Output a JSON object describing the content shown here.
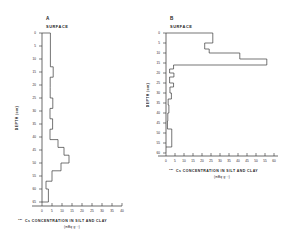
{
  "figure": {
    "background": "#ffffff",
    "line_color": "#3a3a3a",
    "axis_color": "#2b2b2b"
  },
  "chart_data": [
    {
      "type": "area",
      "panel_label": "A",
      "surface_label": "SURFACE",
      "title": "",
      "xlabel": "137Cs CONCENTRATION IN SILT AND CLAY",
      "xlabel_isotope_sup": "137",
      "xlabel_main": "Cs CONCENTRATION IN SILT AND CLAY",
      "xunits": "(mBq·g⁻¹)",
      "ylabel": "DEPTH (cm)",
      "xlim": [
        0,
        40
      ],
      "ylim": [
        0,
        65
      ],
      "grid": false,
      "legend": "none",
      "orientation": "vertical-depth-profile",
      "xticks": [
        0,
        5,
        10,
        15,
        20,
        25,
        30,
        35,
        40
      ],
      "xticklabels": [
        "0",
        "5",
        "10",
        "15",
        "20",
        "25",
        "30",
        "35",
        "40"
      ],
      "yticks": [
        0,
        5,
        10,
        15,
        20,
        25,
        30,
        35,
        40,
        45,
        50,
        55,
        60,
        65
      ],
      "yticklabels": [
        "0",
        "5",
        "10",
        "15",
        "20",
        "25",
        "30",
        "35",
        "40",
        "45",
        "50",
        "55",
        "60",
        "65"
      ],
      "depth_intervals": [
        {
          "top": 0,
          "bottom": 5,
          "value": 4.2
        },
        {
          "top": 5,
          "bottom": 10,
          "value": 4.2
        },
        {
          "top": 10,
          "bottom": 13,
          "value": 4.2
        },
        {
          "top": 13,
          "bottom": 17,
          "value": 5.6
        },
        {
          "top": 17,
          "bottom": 21,
          "value": 4.1
        },
        {
          "top": 21,
          "bottom": 25,
          "value": 4.1
        },
        {
          "top": 25,
          "bottom": 29,
          "value": 5.4
        },
        {
          "top": 29,
          "bottom": 33,
          "value": 4.0
        },
        {
          "top": 33,
          "bottom": 37,
          "value": 5.3
        },
        {
          "top": 37,
          "bottom": 41,
          "value": 4.0
        },
        {
          "top": 41,
          "bottom": 44,
          "value": 8.0
        },
        {
          "top": 44,
          "bottom": 47,
          "value": 11.0
        },
        {
          "top": 47,
          "bottom": 50,
          "value": 13.5
        },
        {
          "top": 50,
          "bottom": 53,
          "value": 9.5
        },
        {
          "top": 53,
          "bottom": 57,
          "value": 5.0
        },
        {
          "top": 57,
          "bottom": 60,
          "value": 2.0
        },
        {
          "top": 60,
          "bottom": 65,
          "value": 3.2
        }
      ]
    },
    {
      "type": "area",
      "panel_label": "B",
      "surface_label": "SURFACE",
      "title": "",
      "xlabel": "137Cs CONCENTRATION IN SILT AND CLAY",
      "xlabel_isotope_sup": "137",
      "xlabel_main": "Cs CONCENTRATION IN SILT AND CLAY",
      "xunits": "(mBq·g⁻¹)",
      "ylabel": "DEPTH (cm)",
      "xlim": [
        0,
        60
      ],
      "ylim": [
        0,
        60
      ],
      "grid": false,
      "legend": "none",
      "orientation": "vertical-depth-profile",
      "xticks": [
        0,
        5,
        10,
        15,
        20,
        25,
        30,
        35,
        40,
        45,
        50,
        55,
        60
      ],
      "xticklabels": [
        "0",
        "5",
        "10",
        "15",
        "20",
        "25",
        "30",
        "35",
        "40",
        "45",
        "50",
        "55",
        "60"
      ],
      "yticks": [
        0,
        5,
        10,
        15,
        20,
        25,
        30,
        35,
        40,
        45,
        50,
        55,
        60
      ],
      "yticklabels": [
        "0",
        "5",
        "10",
        "15",
        "20",
        "25",
        "30",
        "35",
        "40",
        "45",
        "50",
        "55",
        "60"
      ],
      "depth_intervals": [
        {
          "top": 0,
          "bottom": 5,
          "value": 26.0
        },
        {
          "top": 5,
          "bottom": 8,
          "value": 21.5
        },
        {
          "top": 8,
          "bottom": 10,
          "value": 24.0
        },
        {
          "top": 10,
          "bottom": 13,
          "value": 41.0
        },
        {
          "top": 13,
          "bottom": 16,
          "value": 56.0
        },
        {
          "top": 16,
          "bottom": 18,
          "value": 4.2
        },
        {
          "top": 18,
          "bottom": 20,
          "value": 2.0
        },
        {
          "top": 20,
          "bottom": 22,
          "value": 4.4
        },
        {
          "top": 22,
          "bottom": 25,
          "value": 2.0
        },
        {
          "top": 25,
          "bottom": 27,
          "value": 4.2
        },
        {
          "top": 27,
          "bottom": 30,
          "value": 2.2
        },
        {
          "top": 30,
          "bottom": 33,
          "value": 3.0
        },
        {
          "top": 33,
          "bottom": 36,
          "value": 1.2
        },
        {
          "top": 36,
          "bottom": 40,
          "value": 1.6
        },
        {
          "top": 40,
          "bottom": 44,
          "value": 1.0
        },
        {
          "top": 44,
          "bottom": 48,
          "value": 0.8
        },
        {
          "top": 48,
          "bottom": 57,
          "value": 3.2
        }
      ]
    }
  ]
}
